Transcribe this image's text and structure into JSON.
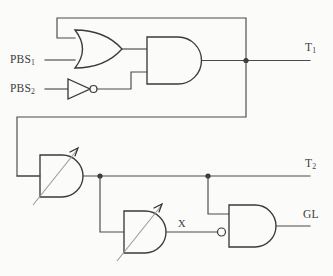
{
  "diagram": {
    "background_color": "#fbfbfa",
    "wire_color": "#4a4a4a",
    "gate_stroke_color": "#3a3a3a"
  },
  "inputs": [
    {
      "id": "pbs1",
      "label": "PBS",
      "subscript": "1"
    },
    {
      "id": "pbs2",
      "label": "PBS",
      "subscript": "2"
    }
  ],
  "outputs": [
    {
      "id": "t1",
      "label": "T",
      "subscript": "1"
    },
    {
      "id": "t2",
      "label": "T",
      "subscript": "2"
    },
    {
      "id": "gl",
      "label": "GL",
      "subscript": ""
    }
  ],
  "internal_signals": [
    {
      "id": "x",
      "label": "X"
    }
  ],
  "gates": [
    {
      "id": "or1",
      "type": "or-gate",
      "inputs": 2,
      "inverted_inputs": [],
      "adjustable": false
    },
    {
      "id": "not1",
      "type": "not-gate",
      "inputs": 1,
      "inverted_inputs": [],
      "adjustable": false
    },
    {
      "id": "and1",
      "type": "and-gate",
      "inputs": 2,
      "inverted_inputs": [],
      "adjustable": false
    },
    {
      "id": "and-delay-1",
      "type": "and-gate-adjustable",
      "inputs": 2,
      "inverted_inputs": [],
      "adjustable": true
    },
    {
      "id": "and-delay-2",
      "type": "and-gate-adjustable",
      "inputs": 2,
      "inverted_inputs": [],
      "adjustable": true
    },
    {
      "id": "nand1",
      "type": "and-gate-inverted-input",
      "inputs": 2,
      "inverted_inputs": [
        "lower"
      ],
      "adjustable": false
    }
  ],
  "junctions": [
    {
      "id": "t1-tap",
      "x": 246,
      "y": 60
    },
    {
      "id": "t2-tap-left",
      "x": 100,
      "y": 176
    },
    {
      "id": "t2-tap-right",
      "x": 208,
      "y": 176
    }
  ]
}
